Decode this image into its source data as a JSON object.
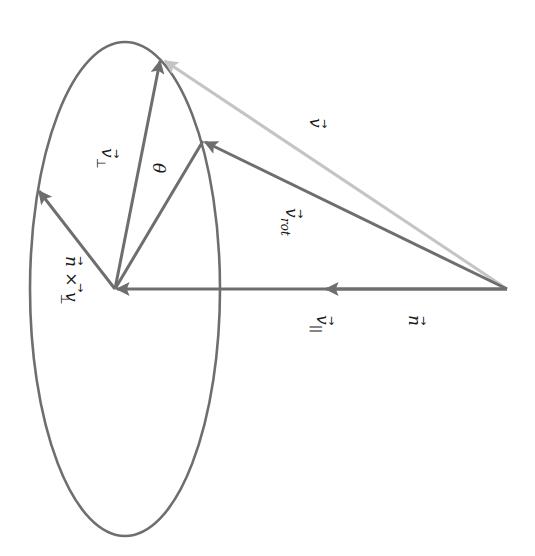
{
  "diagram": {
    "orientation_degrees": 90,
    "colors": {
      "stroke": "#6e6e6e",
      "light_stroke": "#c4c4c4",
      "text": "#1a1a1a",
      "background": "#ffffff"
    },
    "labels": {
      "v": "v",
      "v_rot": "v",
      "v_rot_sub": "rot",
      "v_perp": "v",
      "v_perp_sub": "⊥",
      "v_par": "v",
      "v_par_sub": "||",
      "n": "n",
      "theta": "θ",
      "cross": "n × v",
      "cross_sub": "⊥",
      "arrow_accent": "⃗"
    },
    "vectors": [
      {
        "name": "n",
        "from": [
          507,
          289
        ],
        "to": [
          330,
          289
        ],
        "color": "stroke"
      },
      {
        "name": "v_parallel",
        "from": [
          507,
          289
        ],
        "to": [
          117,
          289
        ],
        "color": "stroke"
      },
      {
        "name": "v",
        "from": [
          507,
          289
        ],
        "to": [
          163,
          60
        ],
        "color": "light_stroke"
      },
      {
        "name": "v_rot",
        "from": [
          507,
          289
        ],
        "to": [
          203,
          141
        ],
        "color": "stroke"
      },
      {
        "name": "v_perp",
        "from": [
          115,
          289
        ],
        "to": [
          160,
          60
        ],
        "color": "stroke"
      },
      {
        "name": "n_cross_v_perp",
        "from": [
          115,
          289
        ],
        "to": [
          38,
          190
        ],
        "color": "stroke"
      },
      {
        "name": "v_rot_perp",
        "from": [
          115,
          289
        ],
        "to": [
          203,
          141
        ],
        "color": "stroke"
      }
    ],
    "ellipse": {
      "cx": 125,
      "cy": 289,
      "rx": 95,
      "ry": 247
    }
  }
}
